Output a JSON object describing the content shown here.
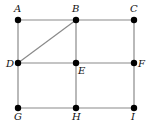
{
  "diagram": {
    "type": "graph",
    "nodes": [
      {
        "id": "A",
        "label": "A",
        "x": 18,
        "y": 20,
        "lx": 14,
        "ly": 12
      },
      {
        "id": "B",
        "label": "B",
        "x": 76,
        "y": 20,
        "lx": 72,
        "ly": 12
      },
      {
        "id": "C",
        "label": "C",
        "x": 134,
        "y": 20,
        "lx": 130,
        "ly": 12
      },
      {
        "id": "D",
        "label": "D",
        "x": 18,
        "y": 63,
        "lx": 6,
        "ly": 67
      },
      {
        "id": "E",
        "label": "E",
        "x": 76,
        "y": 63,
        "lx": 78,
        "ly": 74
      },
      {
        "id": "F",
        "label": "F",
        "x": 134,
        "y": 63,
        "lx": 138,
        "ly": 67
      },
      {
        "id": "G",
        "label": "G",
        "x": 18,
        "y": 108,
        "lx": 14,
        "ly": 120
      },
      {
        "id": "H",
        "label": "H",
        "x": 76,
        "y": 108,
        "lx": 72,
        "ly": 120
      },
      {
        "id": "I",
        "label": "I",
        "x": 134,
        "y": 108,
        "lx": 131,
        "ly": 120
      }
    ],
    "edges": [
      [
        "A",
        "B"
      ],
      [
        "B",
        "C"
      ],
      [
        "D",
        "E"
      ],
      [
        "E",
        "F"
      ],
      [
        "G",
        "H"
      ],
      [
        "H",
        "I"
      ],
      [
        "A",
        "D"
      ],
      [
        "D",
        "G"
      ],
      [
        "B",
        "E"
      ],
      [
        "E",
        "H"
      ],
      [
        "C",
        "F"
      ],
      [
        "F",
        "I"
      ],
      [
        "B",
        "D"
      ]
    ],
    "colors": {
      "edge": "#8a8a8a",
      "node": "#000000",
      "label": "#111111"
    }
  }
}
